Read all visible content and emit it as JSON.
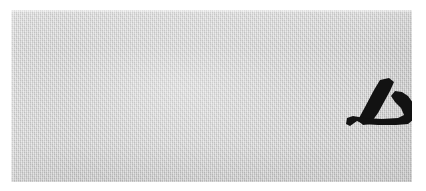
{
  "image": {
    "subject": "handwritten-ink-character",
    "description": "Scanned swatch of light gray paper with a single hand-brushed black ink character",
    "width_px": 426,
    "height_px": 191
  },
  "canvas": {
    "background_color": "#ffffff",
    "margin_left_px": 11,
    "margin_top_px": 10
  },
  "paper": {
    "label": "paper-swatch",
    "fill_color": "#cccccc",
    "texture": "woven-fine-grain",
    "left_px": 11,
    "top_px": 10,
    "width_px": 401,
    "height_px": 172
  },
  "glyph": {
    "label": "handwritten-character",
    "transcription": "厶",
    "ink_color": "#121212",
    "script": "handwritten-cjk-radical",
    "stroke_count": 2,
    "bounding_box": {
      "left_px": 182,
      "top_px": 68,
      "width_px": 51,
      "height_px": 53
    },
    "strokes": [
      {
        "name": "descending-left-stroke",
        "shape": "pie",
        "path": "M 198 3 L 207 1 L 212 5 L 208 14 L 196 36 L 188 47 L 181 48 L 176 43 L 183 30 L 192 13 Z"
      },
      {
        "name": "lower-horizontal-hook-stroke",
        "shape": "heng-zhe",
        "path": "M 175 44 L 181 47 L 196 48 L 214 48 L 226 47 L 232 42 L 234 35 L 231 26 L 226 19 L 220 15 L 213 14 L 209 19 L 213 25 L 219 31 L 222 38 L 216 41 L 200 42 L 182 41 L 171 39 L 165 41 L 164 47 L 168 49 Z"
      }
    ]
  }
}
